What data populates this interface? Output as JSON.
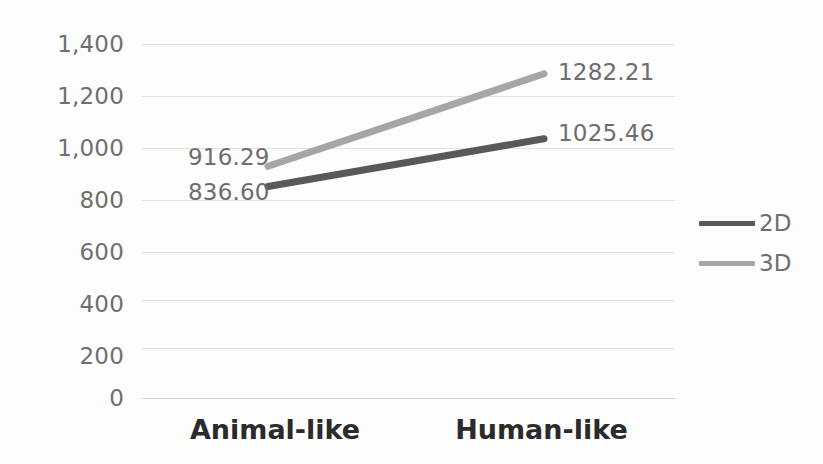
{
  "chart_data": {
    "type": "line",
    "title": "",
    "subtitle": "",
    "xlabel": "",
    "ylabel": "",
    "categories": [
      "Animal-like",
      "Human-like"
    ],
    "series": [
      {
        "name": "2D",
        "values": [
          836.6,
          1025.46
        ],
        "color": "#595959",
        "labels": [
          "836.60",
          "1025.46"
        ]
      },
      {
        "name": "3D",
        "values": [
          916.29,
          1282.21
        ],
        "color": "#a6a6a6",
        "labels": [
          "916.29",
          "1282.21"
        ]
      }
    ],
    "ylim": [
      0,
      1400
    ],
    "ytick_values": [
      0,
      200,
      400,
      600,
      800,
      1000,
      1200,
      1400
    ],
    "ytick_labels": [
      "0",
      "200",
      "400",
      "600",
      "800",
      "1,000",
      "1,200",
      "1,400"
    ],
    "grid": true,
    "legend_position": "right",
    "legend_entries": [
      "2D",
      "3D"
    ],
    "data_labels_shown": true
  },
  "axis": {
    "y": {
      "ticks": [
        {
          "label": "1,400",
          "value": 1400
        },
        {
          "label": "1,200",
          "value": 1200
        },
        {
          "label": "1,000",
          "value": 1000
        },
        {
          "label": "800",
          "value": 800
        },
        {
          "label": "600",
          "value": 600
        },
        {
          "label": "400",
          "value": 400
        },
        {
          "label": "200",
          "value": 200
        },
        {
          "label": "0",
          "value": 0
        }
      ]
    },
    "x": {
      "ticks": [
        {
          "label": "Animal-like"
        },
        {
          "label": "Human-like"
        }
      ]
    }
  },
  "labels": {
    "animal_3d": "916.29",
    "animal_2d": "836.60",
    "human_3d": "1282.21",
    "human_2d": "1025.46"
  },
  "legend": {
    "items": [
      {
        "label": "2D",
        "color": "#595959"
      },
      {
        "label": "3D",
        "color": "#a6a6a6"
      }
    ]
  },
  "colors": {
    "series_2d": "#595959",
    "series_3d": "#a6a6a6",
    "gridline": "#e2e2e2",
    "axis_text": "#6f6f6f",
    "category_text": "#2b2b2b",
    "background": "#fdfdfd"
  }
}
